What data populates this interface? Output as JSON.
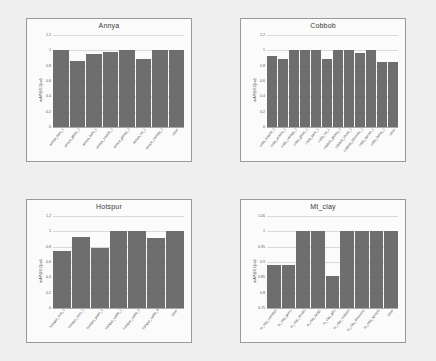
{
  "page": {
    "background": "#efefef",
    "bar_color": "#6e6e6e",
    "grid_color": "#d9d9d9",
    "panel_border": "#9a9a9a"
  },
  "chart_data": [
    {
      "type": "bar",
      "title": "Annya",
      "xlabel": "",
      "ylabel": "mAP@0.5(val)",
      "ylim": [
        0,
        1.2
      ],
      "yticks": [
        "0",
        "0.2",
        "0.4",
        "0.6",
        "0.8",
        "1",
        "1.2"
      ],
      "grid": true,
      "legend": "none",
      "categories": [
        "annya_faux_1",
        "annya_glitter_1",
        "annya_bark_1",
        "annya_nodule_1",
        "annya_glossy_1",
        "annya_rot_1",
        "annya_canopy_1",
        "other"
      ],
      "values": [
        1.0,
        0.86,
        0.95,
        0.98,
        1.0,
        0.89,
        1.0,
        1.0
      ]
    },
    {
      "type": "bar",
      "title": "Cobbob",
      "xlabel": "",
      "ylabel": "mAP@0.5(val)",
      "ylim": [
        0,
        1.2
      ],
      "yticks": [
        "0",
        "0.2",
        "0.4",
        "0.6",
        "0.8",
        "1",
        "1.2"
      ],
      "grid": true,
      "legend": "none",
      "categories": [
        "cobb_nodule_1",
        "cobb_achlea_1",
        "cobb_canopy_1",
        "cobb_glitter_1",
        "cobb_bark_1",
        "cobb_rot_1",
        "cobbob_glossy_1",
        "cobbob_shoot_1",
        "cobbob_blossom_1",
        "cobb_sprout_1",
        "cobb_fauna_1",
        "other"
      ],
      "values": [
        0.92,
        0.89,
        1.0,
        1.0,
        1.0,
        0.89,
        1.0,
        1.0,
        0.96,
        1.0,
        0.85,
        0.85
      ]
    },
    {
      "type": "bar",
      "title": "Hotspur",
      "xlabel": "",
      "ylabel": "mAP@0.5(val)",
      "ylim": [
        0,
        1.2
      ],
      "yticks": [
        "0",
        "0.2",
        "0.4",
        "0.6",
        "0.8",
        "1",
        "1.2"
      ],
      "grid": true,
      "legend": "none",
      "categories": [
        "hotspur_nod_1",
        "hotspur_nest_1",
        "hotspur_pearl_1",
        "hotspur_sable_1",
        "hotspur_sable_2",
        "hotspur_sable_3",
        "other"
      ],
      "values": [
        0.75,
        0.93,
        0.78,
        1.0,
        1.0,
        0.91,
        1.0
      ]
    },
    {
      "type": "bar",
      "title": "Mt_clay",
      "xlabel": "",
      "ylabel": "mAP@0.5(val)",
      "ylim": [
        0.75,
        1.05
      ],
      "yticks": [
        "0.75",
        "0.8",
        "0.85",
        "0.9",
        "0.95",
        "1",
        "1.05"
      ],
      "grid": true,
      "legend": "none",
      "categories": [
        "m_clay_canopy1",
        "m_clay_gum1",
        "m_clay_shrub1",
        "m_clay_fung1",
        "m_clay_glit1",
        "m_clay_nodule1",
        "m_clay_blossom1",
        "m_clay_sprout1",
        "other"
      ],
      "values": [
        0.89,
        0.89,
        1.0,
        1.0,
        0.855,
        1.0,
        1.0,
        1.0,
        1.0
      ]
    }
  ]
}
